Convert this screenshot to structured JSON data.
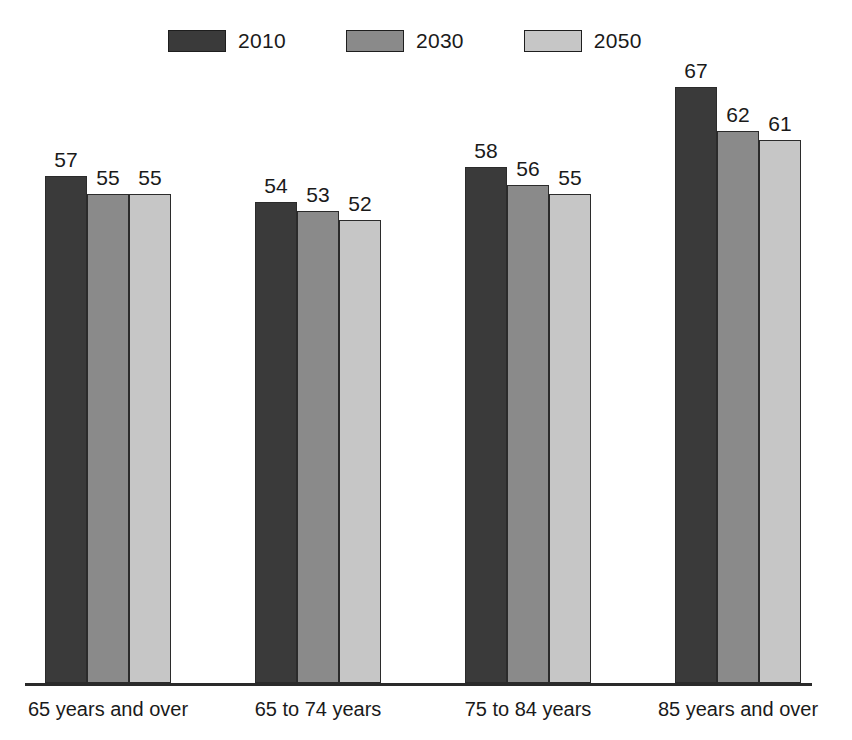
{
  "chart_data": {
    "type": "bar",
    "title": "",
    "subtitle": "",
    "xlabel": "",
    "ylabel": "",
    "grid": false,
    "legend_position": "top",
    "ylim": [
      0,
      72
    ],
    "categories": [
      "65 years and over",
      "65 to 74 years",
      "75 to 84 years",
      "85 years and over"
    ],
    "series": [
      {
        "name": "2010",
        "color": "#3a3a3a",
        "values": [
          57,
          54,
          58,
          67
        ]
      },
      {
        "name": "2030",
        "color": "#8a8a8a",
        "values": [
          55,
          53,
          56,
          62
        ]
      },
      {
        "name": "2050",
        "color": "#c6c6c6",
        "values": [
          55,
          52,
          55,
          61
        ]
      }
    ]
  },
  "legend": {
    "items": [
      {
        "label": "2010",
        "color": "#3a3a3a"
      },
      {
        "label": "2030",
        "color": "#8a8a8a"
      },
      {
        "label": "2050",
        "color": "#c6c6c6"
      }
    ]
  },
  "axis": {
    "baseline_color": "#2a2a2a"
  }
}
